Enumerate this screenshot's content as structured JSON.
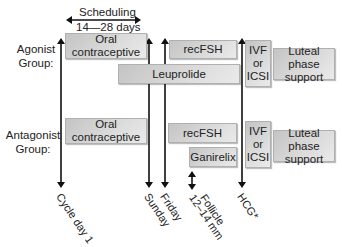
{
  "scheduling": {
    "title": "Scheduling",
    "duration": "14—28 days"
  },
  "groups": {
    "agonist": {
      "label_line1": "Agonist",
      "label_line2": "Group:",
      "oral_contraceptive": {
        "line1": "Oral",
        "line2": "contraceptive"
      },
      "recfsh": "recFSH",
      "leuprolide": "Leuprolide",
      "retrieval": {
        "line1": "IVF",
        "line2": "or",
        "line3": "ICSI"
      },
      "luteal": {
        "line1": "Luteal phase",
        "line2": "support"
      }
    },
    "antagonist": {
      "label_line1": "Antagonist",
      "label_line2": "Group:",
      "oral_contraceptive": {
        "line1": "Oral",
        "line2": "contraceptive"
      },
      "recfsh": "recFSH",
      "ganirelix": "Ganirelix",
      "retrieval": {
        "line1": "IVF",
        "line2": "or",
        "line3": "ICSI"
      },
      "luteal": {
        "line1": "Luteal phase",
        "line2": "support"
      }
    }
  },
  "timeline": {
    "cycle_day_1": "Cycle day 1",
    "sunday": "Sunday",
    "friday": "Friday",
    "follicle_line1": "Follicle",
    "follicle_line2": "12–14 mm",
    "hcg": "HCG*"
  }
}
